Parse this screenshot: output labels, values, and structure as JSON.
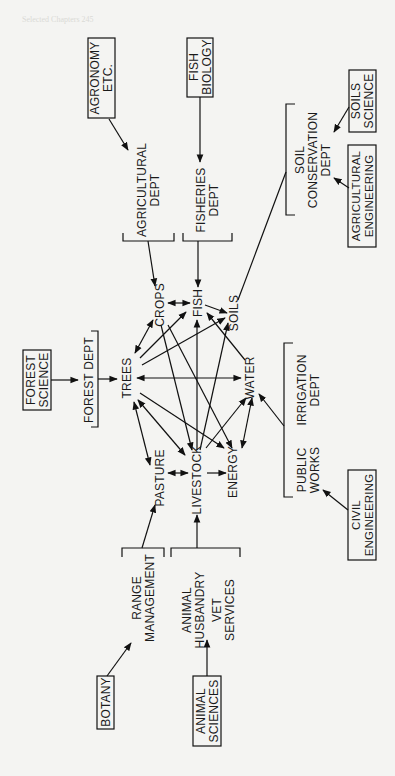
{
  "page": {
    "header": "Selected Chapters 245"
  },
  "diagram": {
    "orientation": "rotated 90° counter-clockwise",
    "resources": {
      "crops": "CROPS",
      "fish": "FISH",
      "soils": "SOILS",
      "trees": "TREES",
      "water": "WATER",
      "pasture": "PASTURE",
      "livestock": "LIVESTOCK",
      "energy": "ENERGY"
    },
    "departments": {
      "agricultural_dept": [
        "AGRICULTURAL",
        "DEPT"
      ],
      "fisheries_dept": [
        "FISHERIES",
        "DEPT"
      ],
      "soil_conservation_dept": [
        "SOIL",
        "CONSERVATION",
        "DEPT"
      ],
      "forest_dept": [
        "FOREST DEPT"
      ],
      "irrigation_dept": [
        "IRRIGATION",
        "DEPT"
      ],
      "public_works": [
        "PUBLIC",
        "WORKS"
      ],
      "range_management": [
        "RANGE",
        "MANAGEMENT"
      ],
      "animal_husbandry_vet": [
        "ANIMAL",
        "HUSBANDRY",
        "VET",
        "SERVICES"
      ]
    },
    "disciplines": {
      "agronomy": [
        "AGRONOMY",
        "ETC."
      ],
      "fish_biology": [
        "FISH",
        "BIOLOGY"
      ],
      "soils_science": [
        "SOILS",
        "SCIENCE"
      ],
      "agricultural_engineering": [
        "AGRICULTURAL",
        "ENGINEERING"
      ],
      "forest_science": [
        "FOREST",
        "SCIENCE"
      ],
      "civil_engineering": [
        "CIVIL",
        "ENGINEERING"
      ],
      "botany": [
        "BOTANY"
      ],
      "animal_sciences": [
        "ANIMAL",
        "SCIENCES"
      ]
    },
    "flows": [
      {
        "from": "AGRONOMY ETC.",
        "to": "AGRICULTURAL DEPT"
      },
      {
        "from": "FISH BIOLOGY",
        "to": "FISHERIES DEPT"
      },
      {
        "from": "SOILS SCIENCE",
        "to": "SOIL CONSERVATION DEPT"
      },
      {
        "from": "AGRICULTURAL ENGINEERING",
        "to": "SOIL CONSERVATION DEPT"
      },
      {
        "from": "FOREST SCIENCE",
        "to": "FOREST DEPT"
      },
      {
        "from": "CIVIL ENGINEERING",
        "to": "PUBLIC WORKS"
      },
      {
        "from": "BOTANY",
        "to": "RANGE MANAGEMENT"
      },
      {
        "from": "ANIMAL SCIENCES",
        "to": "ANIMAL HUSBANDRY / VET SERVICES"
      },
      {
        "from": "AGRICULTURAL DEPT",
        "to": "CROPS"
      },
      {
        "from": "FISHERIES DEPT",
        "to": "FISH"
      },
      {
        "from": "SOIL CONSERVATION DEPT",
        "to": "SOILS"
      },
      {
        "from": "FOREST DEPT",
        "to": "TREES"
      },
      {
        "from": "IRRIGATION DEPT / PUBLIC WORKS",
        "to": "WATER"
      },
      {
        "from": "RANGE MANAGEMENT",
        "to": "PASTURE"
      },
      {
        "from": "ANIMAL HUSBANDRY / VET SERVICES",
        "to": "LIVESTOCK"
      },
      {
        "from": "CROPS",
        "to": "FISH",
        "both": true
      },
      {
        "from": "FISH",
        "to": "SOILS"
      },
      {
        "from": "TREES",
        "to": "CROPS",
        "both": true
      },
      {
        "from": "TREES",
        "to": "FISH"
      },
      {
        "from": "TREES",
        "to": "SOILS"
      },
      {
        "from": "TREES",
        "to": "WATER",
        "both": true
      },
      {
        "from": "TREES",
        "to": "PASTURE",
        "both": true
      },
      {
        "from": "TREES",
        "to": "LIVESTOCK",
        "both": true
      },
      {
        "from": "TREES",
        "to": "ENERGY"
      },
      {
        "from": "WATER",
        "to": "FISH"
      },
      {
        "from": "WATER",
        "to": "ENERGY",
        "both": true
      },
      {
        "from": "LIVESTOCK",
        "to": "WATER"
      },
      {
        "from": "LIVESTOCK",
        "to": "FISH"
      },
      {
        "from": "LIVESTOCK",
        "to": "SOILS"
      },
      {
        "from": "CROPS",
        "to": "LIVESTOCK"
      },
      {
        "from": "CROPS",
        "to": "ENERGY"
      },
      {
        "from": "PASTURE",
        "to": "LIVESTOCK",
        "both": true
      },
      {
        "from": "LIVESTOCK",
        "to": "ENERGY"
      }
    ]
  }
}
